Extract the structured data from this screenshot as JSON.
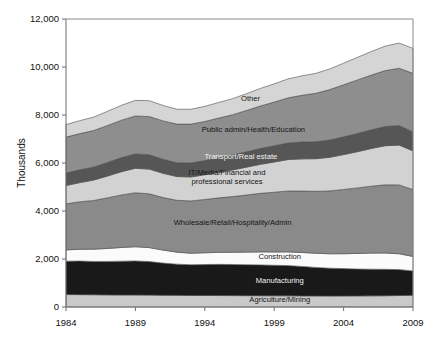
{
  "chart_data": {
    "type": "area",
    "stacked": true,
    "title": "",
    "subtitle": "",
    "xlabel": "",
    "ylabel": "Thousands",
    "xlim": [
      1984,
      2009
    ],
    "ylim": [
      0,
      12000
    ],
    "ytick_labels": [
      "12,000",
      "10,000",
      "8,000",
      "6,000",
      "4,000",
      "2,000",
      "0"
    ],
    "ytick_values": [
      12000,
      10000,
      8000,
      6000,
      4000,
      2000,
      0
    ],
    "xtick_labels": [
      "1984",
      "1989",
      "1994",
      "1999",
      "2004",
      "2009"
    ],
    "xtick_values": [
      1984,
      1989,
      1994,
      1999,
      2004,
      2009
    ],
    "grid": false,
    "legend": "inline-labels",
    "x": [
      1984,
      1985,
      1986,
      1987,
      1988,
      1989,
      1990,
      1991,
      1992,
      1993,
      1994,
      1995,
      1996,
      1997,
      1998,
      1999,
      2000,
      2001,
      2002,
      2003,
      2004,
      2005,
      2006,
      2007,
      2008,
      2009
    ],
    "series": [
      {
        "name": "Agriculture/Mining",
        "color": "#c9c9c9",
        "label": "Agriculture/Mining",
        "label_color": "dark",
        "values": [
          520,
          515,
          510,
          505,
          500,
          500,
          495,
          490,
          485,
          480,
          480,
          478,
          475,
          472,
          470,
          468,
          465,
          462,
          460,
          458,
          460,
          462,
          465,
          470,
          478,
          485
        ]
      },
      {
        "name": "Manufacturing",
        "color": "#191919",
        "label": "Manufacturing",
        "label_color": "light",
        "values": [
          1390,
          1400,
          1390,
          1395,
          1410,
          1420,
          1400,
          1340,
          1300,
          1280,
          1290,
          1300,
          1295,
          1290,
          1285,
          1270,
          1260,
          1230,
          1190,
          1160,
          1140,
          1120,
          1110,
          1100,
          1080,
          1020
        ]
      },
      {
        "name": "Construction",
        "color": "#fbfbfb",
        "label": "Construction",
        "label_color": "dark",
        "values": [
          470,
          490,
          510,
          540,
          570,
          590,
          580,
          540,
          500,
          480,
          490,
          500,
          510,
          525,
          540,
          555,
          570,
          580,
          590,
          600,
          620,
          650,
          670,
          680,
          660,
          600
        ]
      },
      {
        "name": "Wholesale/Retail/Hospitality/Admin",
        "color": "#8a8a8a",
        "label": "Wholesale/Retail/Hospitality/Admin",
        "label_color": "dark",
        "values": [
          1920,
          1980,
          2030,
          2110,
          2190,
          2250,
          2240,
          2190,
          2160,
          2180,
          2220,
          2270,
          2320,
          2380,
          2440,
          2490,
          2540,
          2560,
          2580,
          2620,
          2680,
          2730,
          2790,
          2840,
          2870,
          2790
        ]
      },
      {
        "name": "IT/Media/Financial and professional services",
        "color": "#d2d2d2",
        "label": "IT/Media/Financial and\nprofessional services",
        "label_color": "dark",
        "values": [
          760,
          800,
          850,
          910,
          970,
          1020,
          1030,
          1010,
          990,
          1000,
          1030,
          1070,
          1110,
          1160,
          1210,
          1260,
          1310,
          1340,
          1360,
          1400,
          1450,
          1510,
          1570,
          1630,
          1660,
          1610
        ]
      },
      {
        "name": "Transport/Real estate",
        "color": "#565656",
        "label": "Transport/Real estate",
        "label_color": "light",
        "values": [
          520,
          530,
          545,
          565,
          585,
          600,
          600,
          585,
          575,
          580,
          590,
          605,
          620,
          640,
          660,
          675,
          690,
          700,
          705,
          720,
          740,
          760,
          780,
          800,
          810,
          790
        ]
      },
      {
        "name": "Public admin/Health/Education",
        "color": "#8e8e8e",
        "label": "Public admin/Health/Education",
        "label_color": "dark",
        "values": [
          1500,
          1510,
          1520,
          1540,
          1560,
          1580,
          1590,
          1600,
          1610,
          1620,
          1630,
          1650,
          1680,
          1720,
          1770,
          1820,
          1880,
          1950,
          2020,
          2100,
          2170,
          2230,
          2280,
          2330,
          2390,
          2440
        ]
      },
      {
        "name": "Other",
        "color": "#d5d5d5",
        "label": "Other",
        "label_color": "dark",
        "values": [
          520,
          540,
          560,
          590,
          620,
          650,
          660,
          640,
          620,
          620,
          630,
          650,
          670,
          700,
          730,
          760,
          790,
          810,
          830,
          860,
          900,
          940,
          980,
          1020,
          1050,
          1040
        ]
      }
    ],
    "series_label_anchors": [
      {
        "name": "Agriculture/Mining",
        "x": 1999.4,
        "y": 310
      },
      {
        "name": "Manufacturing",
        "x": 1999.4,
        "y": 1080
      },
      {
        "name": "Construction",
        "x": 1999.4,
        "y": 2080
      },
      {
        "name": "Wholesale/Retail/Hospitality/Admin",
        "x": 1996.0,
        "y": 3500
      },
      {
        "name": "IT/Media/Financial and professional services",
        "x": 1995.6,
        "y": 5400
      },
      {
        "name": "Transport/Real estate",
        "x": 1996.6,
        "y": 6270
      },
      {
        "name": "Public admin/Health/Education",
        "x": 1997.5,
        "y": 7380
      },
      {
        "name": "Other",
        "x": 1997.3,
        "y": 8660
      }
    ]
  },
  "axis": {
    "y_title": "Thousands"
  }
}
